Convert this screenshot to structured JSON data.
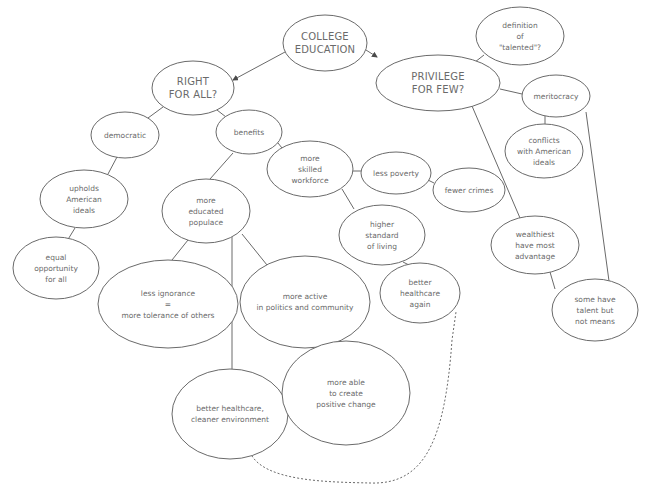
{
  "diagram": {
    "type": "concept-map",
    "colors": {
      "stroke": "#6a6a6a",
      "text": "#6a6a6a",
      "background": "#ffffff"
    },
    "nodes": [
      {
        "id": "college",
        "lines": [
          "COLLEGE",
          "EDUCATION"
        ],
        "cx": 325,
        "cy": 43,
        "rx": 42,
        "ry": 28,
        "main": true
      },
      {
        "id": "right",
        "lines": [
          "RIGHT",
          "FOR ALL?"
        ],
        "cx": 193,
        "cy": 88,
        "rx": 41,
        "ry": 27,
        "main": true
      },
      {
        "id": "privilege",
        "lines": [
          "PRIVILEGE",
          "FOR FEW?"
        ],
        "cx": 438,
        "cy": 83,
        "rx": 62,
        "ry": 28,
        "main": true
      },
      {
        "id": "talented",
        "lines": [
          "definition",
          "of",
          "\"talented\"?"
        ],
        "cx": 520,
        "cy": 36,
        "rx": 44,
        "ry": 29
      },
      {
        "id": "meritocracy",
        "lines": [
          "meritocracy"
        ],
        "cx": 556,
        "cy": 96,
        "rx": 34,
        "ry": 21
      },
      {
        "id": "conflicts",
        "lines": [
          "conflicts",
          "with American",
          "ideals"
        ],
        "cx": 544,
        "cy": 151,
        "rx": 39,
        "ry": 27
      },
      {
        "id": "democratic",
        "lines": [
          "democratic"
        ],
        "cx": 125,
        "cy": 135,
        "rx": 34,
        "ry": 23
      },
      {
        "id": "benefits",
        "lines": [
          "benefits"
        ],
        "cx": 249,
        "cy": 132,
        "rx": 33,
        "ry": 22
      },
      {
        "id": "upholds",
        "lines": [
          "upholds",
          "American",
          "ideals"
        ],
        "cx": 84,
        "cy": 199,
        "rx": 44,
        "ry": 29
      },
      {
        "id": "equal",
        "lines": [
          "equal",
          "opportunity",
          "for all"
        ],
        "cx": 56,
        "cy": 268,
        "rx": 43,
        "ry": 31
      },
      {
        "id": "skilled",
        "lines": [
          "more",
          "skilled",
          "workforce"
        ],
        "cx": 310,
        "cy": 169,
        "rx": 43,
        "ry": 28
      },
      {
        "id": "poverty",
        "lines": [
          "less poverty"
        ],
        "cx": 396,
        "cy": 173,
        "rx": 35,
        "ry": 21
      },
      {
        "id": "crimes",
        "lines": [
          "fewer crimes"
        ],
        "cx": 469,
        "cy": 190,
        "rx": 36,
        "ry": 22
      },
      {
        "id": "educated",
        "lines": [
          "more",
          "educated",
          "populace"
        ],
        "cx": 206,
        "cy": 211,
        "rx": 44,
        "ry": 32
      },
      {
        "id": "higher",
        "lines": [
          "higher",
          "standard",
          "of living"
        ],
        "cx": 382,
        "cy": 235,
        "rx": 43,
        "ry": 30
      },
      {
        "id": "wealthiest",
        "lines": [
          "wealthiest",
          "have most",
          "advantage"
        ],
        "cx": 535,
        "cy": 245,
        "rx": 44,
        "ry": 29
      },
      {
        "id": "ignorance",
        "lines": [
          "less ignorance",
          "=",
          "more tolerance of others"
        ],
        "cx": 168,
        "cy": 304,
        "rx": 70,
        "ry": 44
      },
      {
        "id": "active",
        "lines": [
          "more active",
          "in politics and community"
        ],
        "cx": 305,
        "cy": 302,
        "rx": 65,
        "ry": 46
      },
      {
        "id": "healthcare-again",
        "lines": [
          "better",
          "healthcare",
          "again"
        ],
        "cx": 420,
        "cy": 293,
        "rx": 40,
        "ry": 30
      },
      {
        "id": "talent-means",
        "lines": [
          "some have",
          "talent but",
          "not means"
        ],
        "cx": 595,
        "cy": 310,
        "rx": 43,
        "ry": 31
      },
      {
        "id": "healthcare-env",
        "lines": [
          "better healthcare,",
          "cleaner environment"
        ],
        "cx": 230,
        "cy": 414,
        "rx": 58,
        "ry": 45
      },
      {
        "id": "positive",
        "lines": [
          "more able",
          "to create",
          "positive change"
        ],
        "cx": 346,
        "cy": 393,
        "rx": 64,
        "ry": 52
      }
    ],
    "edges": [
      {
        "from": "college",
        "to": "right",
        "x1": 285,
        "y1": 52,
        "x2": 233,
        "y2": 80,
        "arrow": true
      },
      {
        "from": "college",
        "to": "privilege",
        "x1": 366,
        "y1": 50,
        "x2": 377,
        "y2": 57,
        "arrow": true
      },
      {
        "from": "privilege",
        "to": "talented",
        "x1": 475,
        "y1": 62,
        "x2": 484,
        "y2": 55
      },
      {
        "from": "privilege",
        "to": "meritocracy",
        "x1": 500,
        "y1": 89,
        "x2": 522,
        "y2": 94
      },
      {
        "from": "meritocracy",
        "to": "conflicts",
        "x1": 545,
        "y1": 116,
        "x2": 545,
        "y2": 124
      },
      {
        "from": "meritocracy",
        "to": "talent-means",
        "x1": 586,
        "y1": 112,
        "x2": 609,
        "y2": 281
      },
      {
        "from": "privilege",
        "to": "wealthiest",
        "x1": 472,
        "y1": 106,
        "x2": 520,
        "y2": 218
      },
      {
        "from": "wealthiest",
        "to": "talent-means",
        "x1": 550,
        "y1": 272,
        "x2": 555,
        "y2": 289
      },
      {
        "from": "right",
        "to": "democratic",
        "x1": 163,
        "y1": 107,
        "x2": 148,
        "y2": 118
      },
      {
        "from": "right",
        "to": "benefits",
        "x1": 217,
        "y1": 110,
        "x2": 226,
        "y2": 117
      },
      {
        "from": "democratic",
        "to": "upholds",
        "x1": 117,
        "y1": 157,
        "x2": 108,
        "y2": 174
      },
      {
        "from": "upholds",
        "to": "equal",
        "x1": 75,
        "y1": 228,
        "x2": 67,
        "y2": 241
      },
      {
        "from": "benefits",
        "to": "skilled",
        "x1": 278,
        "y1": 143,
        "x2": 282,
        "y2": 148
      },
      {
        "from": "benefits",
        "to": "educated",
        "x1": 233,
        "y1": 153,
        "x2": 210,
        "y2": 179
      },
      {
        "from": "skilled",
        "to": "poverty",
        "x1": 353,
        "y1": 171,
        "x2": 361,
        "y2": 171
      },
      {
        "from": "poverty",
        "to": "crimes",
        "x1": 428,
        "y1": 180,
        "x2": 434,
        "y2": 183
      },
      {
        "from": "skilled",
        "to": "higher",
        "x1": 342,
        "y1": 189,
        "x2": 354,
        "y2": 209
      },
      {
        "from": "higher",
        "to": "healthcare-again",
        "x1": 403,
        "y1": 262,
        "x2": 409,
        "y2": 265
      },
      {
        "from": "educated",
        "to": "ignorance",
        "x1": 188,
        "y1": 240,
        "x2": 172,
        "y2": 260
      },
      {
        "from": "educated",
        "to": "healthcare-env",
        "x1": 232,
        "y1": 237,
        "x2": 232,
        "y2": 369
      },
      {
        "from": "educated",
        "to": "active",
        "x1": 242,
        "y1": 234,
        "x2": 267,
        "y2": 265
      },
      {
        "from": "active",
        "to": "positive",
        "x1": 324,
        "y1": 347,
        "x2": 326,
        "y2": 368
      }
    ],
    "dashed_edges": [
      {
        "from": "healthcare-env",
        "to": "healthcare-again",
        "path": "M 250 452 C 262 482, 330 482, 370 483 C 425 485, 445 440, 452 340 L 456 312"
      }
    ],
    "caption_cutoff": "...concept map of college education..."
  }
}
